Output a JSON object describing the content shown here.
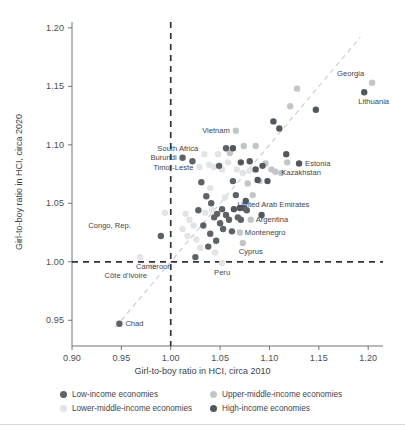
{
  "axes": {
    "x_title": "Girl-to-boy ratio in HCI, circa 2010",
    "y_title": "Girl-to-boy ratio in HCI, circa 2020",
    "x_ticks": [
      "0.90",
      "0.95",
      "1.00",
      "1.05",
      "1.10",
      "1.15",
      "1.20"
    ],
    "y_ticks": [
      "0.95",
      "1.00",
      "1.05",
      "1.10",
      "1.15",
      "1.20"
    ]
  },
  "legend": {
    "items": [
      {
        "label": "Low-income economies",
        "color": "#5d6268"
      },
      {
        "label": "Upper-middle-income economies",
        "color": "#c3c6c9"
      },
      {
        "label": "Lower-middle-income economies",
        "color": "#e2e4e5"
      },
      {
        "label": "High-income economies",
        "color": "#53585e"
      }
    ]
  },
  "chart_data": {
    "type": "scatter",
    "title": "",
    "xlabel": "Girl-to-boy ratio in HCI, circa 2010",
    "ylabel": "Girl-to-boy ratio in HCI, circa 2020",
    "xlim": [
      0.9,
      1.215
    ],
    "ylim": [
      0.928,
      1.205
    ],
    "grid": false,
    "legend_position": "bottom",
    "reference_lines": [
      {
        "name": "parity-x",
        "type": "vertical",
        "value": 1.0,
        "style": "dashed"
      },
      {
        "name": "parity-y",
        "type": "horizontal",
        "value": 1.0,
        "style": "dashed"
      },
      {
        "name": "identity",
        "type": "diagonal",
        "from": [
          0.944,
          0.944
        ],
        "to": [
          1.192,
          1.192
        ],
        "style": "dashed"
      }
    ],
    "series": [
      {
        "name": "Low-income economies",
        "color": "#5d6268",
        "points": [
          {
            "label": "Chad",
            "x": 0.948,
            "y": 0.947
          },
          {
            "label": "Congo, Rep.",
            "x": 0.99,
            "y": 1.022
          },
          {
            "label": "Burundi",
            "x": 1.012,
            "y": 1.089
          },
          {
            "label": "",
            "x": 1.022,
            "y": 1.086
          },
          {
            "label": "",
            "x": 1.031,
            "y": 1.068
          },
          {
            "label": "",
            "x": 1.028,
            "y": 1.044
          },
          {
            "label": "",
            "x": 1.036,
            "y": 1.056
          },
          {
            "label": "",
            "x": 1.041,
            "y": 1.05
          },
          {
            "label": "",
            "x": 1.033,
            "y": 1.031
          },
          {
            "label": "",
            "x": 1.04,
            "y": 1.024
          },
          {
            "label": "",
            "x": 1.044,
            "y": 1.038
          },
          {
            "label": "",
            "x": 1.047,
            "y": 1.041
          },
          {
            "label": "",
            "x": 1.038,
            "y": 1.013
          },
          {
            "label": "",
            "x": 1.05,
            "y": 1.033
          },
          {
            "label": "",
            "x": 1.053,
            "y": 1.028
          },
          {
            "label": "",
            "x": 1.046,
            "y": 1.018
          },
          {
            "label": "",
            "x": 1.052,
            "y": 1.045
          },
          {
            "label": "",
            "x": 1.056,
            "y": 1.04
          },
          {
            "label": "",
            "x": 1.059,
            "y": 1.036
          },
          {
            "label": "",
            "x": 1.049,
            "y": 1.082
          },
          {
            "label": "",
            "x": 1.056,
            "y": 1.097
          },
          {
            "label": "",
            "x": 1.063,
            "y": 1.069
          },
          {
            "label": "",
            "x": 1.066,
            "y": 1.057
          },
          {
            "label": "",
            "x": 1.068,
            "y": 1.038
          },
          {
            "label": "",
            "x": 1.071,
            "y": 1.036
          },
          {
            "label": "",
            "x": 1.074,
            "y": 1.046
          },
          {
            "label": "",
            "x": 1.077,
            "y": 1.044
          },
          {
            "label": "",
            "x": 1.062,
            "y": 1.026
          },
          {
            "label": "",
            "x": 1.025,
            "y": 1.004
          }
        ]
      },
      {
        "name": "Lower-middle-income economies",
        "color": "#e2e4e5",
        "points": [
          {
            "label": "Côte d'Ivoire",
            "x": 0.982,
            "y": 0.996
          },
          {
            "label": "Cameroon",
            "x": 0.969,
            "y": 1.004
          },
          {
            "label": "",
            "x": 0.994,
            "y": 1.042
          },
          {
            "label": "",
            "x": 1.015,
            "y": 1.041
          },
          {
            "label": "",
            "x": 1.019,
            "y": 1.036
          },
          {
            "label": "",
            "x": 1.012,
            "y": 1.028
          },
          {
            "label": "",
            "x": 1.017,
            "y": 1.022
          },
          {
            "label": "",
            "x": 1.023,
            "y": 1.031
          },
          {
            "label": "",
            "x": 1.026,
            "y": 1.019
          },
          {
            "label": "",
            "x": 1.03,
            "y": 1.012
          },
          {
            "label": "",
            "x": 1.035,
            "y": 1.042
          },
          {
            "label": "",
            "x": 1.042,
            "y": 1.044
          },
          {
            "label": "Timor-Leste",
            "x": 1.029,
            "y": 1.081
          },
          {
            "label": "South Africa",
            "x": 1.034,
            "y": 1.092
          },
          {
            "label": "",
            "x": 1.039,
            "y": 1.083
          },
          {
            "label": "",
            "x": 1.044,
            "y": 1.081
          },
          {
            "label": "",
            "x": 1.048,
            "y": 1.092
          },
          {
            "label": "",
            "x": 1.052,
            "y": 1.079
          },
          {
            "label": "",
            "x": 1.04,
            "y": 1.063
          },
          {
            "label": "",
            "x": 1.045,
            "y": 1.008
          },
          {
            "label": "",
            "x": 1.055,
            "y": 1.055
          },
          {
            "label": "",
            "x": 1.058,
            "y": 1.085
          },
          {
            "label": "",
            "x": 1.067,
            "y": 1.079
          },
          {
            "label": "",
            "x": 1.073,
            "y": 1.076
          },
          {
            "label": "",
            "x": 1.08,
            "y": 1.078
          },
          {
            "label": "Peru",
            "x": 1.052,
            "y": 0.999
          }
        ]
      },
      {
        "name": "Upper-middle-income economies",
        "color": "#c3c6c9",
        "points": [
          {
            "label": "Vietnam",
            "x": 1.066,
            "y": 1.112
          },
          {
            "label": "Montenegro",
            "x": 1.07,
            "y": 1.025
          },
          {
            "label": "Cyprus",
            "x": 1.073,
            "y": 1.016
          },
          {
            "label": "Argentina",
            "x": 1.081,
            "y": 1.036
          },
          {
            "label": "Georgia",
            "x": 1.204,
            "y": 1.153
          },
          {
            "label": "",
            "x": 1.06,
            "y": 1.093
          },
          {
            "label": "",
            "x": 1.086,
            "y": 1.099
          },
          {
            "label": "",
            "x": 1.096,
            "y": 1.084
          },
          {
            "label": "",
            "x": 1.102,
            "y": 1.079
          },
          {
            "label": "",
            "x": 1.106,
            "y": 1.077
          },
          {
            "label": "",
            "x": 1.112,
            "y": 1.076
          },
          {
            "label": "Kazakhstan",
            "x": 1.118,
            "y": 1.085
          },
          {
            "label": "",
            "x": 1.09,
            "y": 1.069
          },
          {
            "label": "",
            "x": 1.083,
            "y": 1.057
          },
          {
            "label": "",
            "x": 1.078,
            "y": 1.067
          },
          {
            "label": "",
            "x": 1.128,
            "y": 1.148
          },
          {
            "label": "",
            "x": 1.121,
            "y": 1.133
          },
          {
            "label": "",
            "x": 1.074,
            "y": 1.099
          }
        ]
      },
      {
        "name": "High-income economies",
        "color": "#53585e",
        "points": [
          {
            "label": "Lithuania",
            "x": 1.196,
            "y": 1.145
          },
          {
            "label": "Estonia",
            "x": 1.13,
            "y": 1.084
          },
          {
            "label": "United Arab Emirates",
            "x": 1.092,
            "y": 1.04
          },
          {
            "label": "",
            "x": 1.104,
            "y": 1.12
          },
          {
            "label": "",
            "x": 1.11,
            "y": 1.114
          },
          {
            "label": "",
            "x": 1.117,
            "y": 1.092
          },
          {
            "label": "",
            "x": 1.147,
            "y": 1.13
          },
          {
            "label": "",
            "x": 1.086,
            "y": 1.079
          },
          {
            "label": "",
            "x": 1.08,
            "y": 1.086
          },
          {
            "label": "",
            "x": 1.071,
            "y": 1.085
          },
          {
            "label": "",
            "x": 1.063,
            "y": 1.097
          },
          {
            "label": "",
            "x": 1.093,
            "y": 1.082
          },
          {
            "label": "",
            "x": 1.098,
            "y": 1.069
          },
          {
            "label": "",
            "x": 1.088,
            "y": 1.07
          },
          {
            "label": "",
            "x": 1.076,
            "y": 1.052
          },
          {
            "label": "",
            "x": 1.07,
            "y": 1.046
          },
          {
            "label": "",
            "x": 1.064,
            "y": 1.045
          }
        ]
      }
    ],
    "annotations": [
      {
        "label": "Georgia",
        "x": 1.204,
        "y": 1.153,
        "align": "right",
        "dx": -8,
        "dy": -7
      },
      {
        "label": "Lithuania",
        "x": 1.196,
        "y": 1.145,
        "align": "left",
        "dx": -6,
        "dy": 12
      },
      {
        "label": "Vietnam",
        "x": 1.066,
        "y": 1.112,
        "align": "right",
        "dx": -6,
        "dy": 2.5
      },
      {
        "label": "South Africa",
        "x": 1.034,
        "y": 1.092,
        "align": "right",
        "dx": -6,
        "dy": -3
      },
      {
        "label": "Burundi",
        "x": 1.012,
        "y": 1.089,
        "align": "right",
        "dx": -6,
        "dy": 2.5
      },
      {
        "label": "Timor-Leste",
        "x": 1.029,
        "y": 1.081,
        "align": "right",
        "dx": -6,
        "dy": 2.5
      },
      {
        "label": "Estonia",
        "x": 1.13,
        "y": 1.084,
        "align": "left",
        "dx": 6,
        "dy": 2.5
      },
      {
        "label": "Kazakhstan",
        "x": 1.118,
        "y": 1.085,
        "align": "left",
        "dx": -6,
        "dy": 13
      },
      {
        "label": "Congo, Rep.",
        "x": 0.99,
        "y": 1.022,
        "align": "right",
        "dx": -30,
        "dy": -8
      },
      {
        "label": "United Arab Emirates",
        "x": 1.092,
        "y": 1.04,
        "align": "left",
        "dx": -24,
        "dy": -8
      },
      {
        "label": "Argentina",
        "x": 1.081,
        "y": 1.036,
        "align": "left",
        "dx": 5,
        "dy": 2.5
      },
      {
        "label": "Montenegro",
        "x": 1.07,
        "y": 1.025,
        "align": "left",
        "dx": 5,
        "dy": 2.5
      },
      {
        "label": "Cyprus",
        "x": 1.073,
        "y": 1.016,
        "align": "left",
        "dx": -4,
        "dy": 11
      },
      {
        "label": "Cameroon",
        "x": 0.969,
        "y": 1.004,
        "align": "left",
        "dx": -4,
        "dy": 12
      },
      {
        "label": "Côte d'Ivoire",
        "x": 0.982,
        "y": 0.996,
        "align": "right",
        "dx": -6,
        "dy": 12
      },
      {
        "label": "Peru",
        "x": 1.052,
        "y": 0.999,
        "align": "left",
        "dx": -8,
        "dy": 12
      },
      {
        "label": "Chad",
        "x": 0.948,
        "y": 0.947,
        "align": "left",
        "dx": 6,
        "dy": 2.5
      }
    ]
  }
}
